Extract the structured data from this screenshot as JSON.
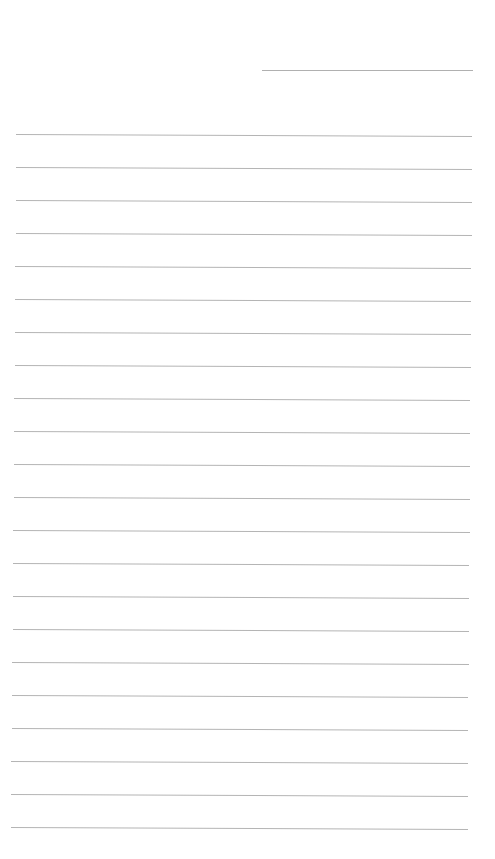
{
  "document": {
    "type": "lined-paper",
    "background_color": "#ffffff",
    "line_color": "#b4b4b4",
    "header_line": {
      "x1": 262,
      "x2": 473,
      "y": 70
    },
    "ruled_lines": [
      {
        "y": 134,
        "x1": 16,
        "x2": 472
      },
      {
        "y": 167,
        "x1": 16,
        "x2": 472
      },
      {
        "y": 200,
        "x1": 16,
        "x2": 472
      },
      {
        "y": 233,
        "x1": 16,
        "x2": 472
      },
      {
        "y": 266,
        "x1": 15,
        "x2": 471
      },
      {
        "y": 299,
        "x1": 15,
        "x2": 471
      },
      {
        "y": 332,
        "x1": 15,
        "x2": 471
      },
      {
        "y": 365,
        "x1": 15,
        "x2": 471
      },
      {
        "y": 398,
        "x1": 14,
        "x2": 470
      },
      {
        "y": 431,
        "x1": 14,
        "x2": 470
      },
      {
        "y": 464,
        "x1": 14,
        "x2": 470
      },
      {
        "y": 497,
        "x1": 14,
        "x2": 470
      },
      {
        "y": 530,
        "x1": 13,
        "x2": 470
      },
      {
        "y": 563,
        "x1": 13,
        "x2": 469
      },
      {
        "y": 596,
        "x1": 13,
        "x2": 469
      },
      {
        "y": 629,
        "x1": 13,
        "x2": 469
      },
      {
        "y": 662,
        "x1": 12,
        "x2": 469
      },
      {
        "y": 695,
        "x1": 12,
        "x2": 468
      },
      {
        "y": 728,
        "x1": 12,
        "x2": 468
      },
      {
        "y": 761,
        "x1": 11,
        "x2": 468
      },
      {
        "y": 794,
        "x1": 11,
        "x2": 468
      },
      {
        "y": 827,
        "x1": 11,
        "x2": 468
      }
    ]
  }
}
